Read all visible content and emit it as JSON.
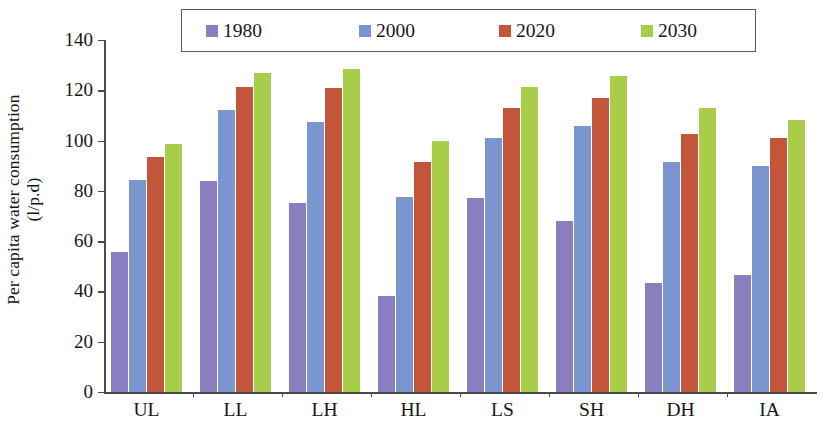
{
  "chart_data": {
    "type": "bar",
    "title": "",
    "xlabel": "",
    "ylabel": "Per capita water consumption (l/p.d)",
    "ylabel_line1": "Per capita water consumption",
    "ylabel_line2": "(l/p.d)",
    "ylim": [
      0,
      140
    ],
    "yticks": [
      0,
      20,
      40,
      60,
      80,
      100,
      120,
      140
    ],
    "ytick_labels": [
      "0",
      "20",
      "40",
      "60",
      "80",
      "100",
      "120",
      "140"
    ],
    "grid": false,
    "legend_position": "top-center",
    "categories": [
      "UL",
      "LL",
      "LH",
      "HL",
      "LS",
      "SH",
      "DH",
      "IA"
    ],
    "series": [
      {
        "name": "1980",
        "color": "#8a7dc0",
        "values": [
          55.5,
          84,
          75,
          38,
          77,
          68,
          43.5,
          46.5
        ]
      },
      {
        "name": "2000",
        "color": "#7b95cf",
        "values": [
          84.5,
          112,
          107.5,
          77.5,
          101,
          106,
          91.5,
          90
        ]
      },
      {
        "name": "2020",
        "color": "#c2553a",
        "values": [
          93.5,
          121.5,
          121,
          91.5,
          113,
          117,
          102.5,
          101
        ]
      },
      {
        "name": "2030",
        "color": "#a9cc4b",
        "values": [
          98.5,
          127,
          128.5,
          100,
          121.5,
          125.5,
          113,
          108
        ]
      }
    ]
  },
  "legend": {
    "entries": [
      {
        "label": "1980"
      },
      {
        "label": "2000"
      },
      {
        "label": "2020"
      },
      {
        "label": "2030"
      }
    ]
  }
}
